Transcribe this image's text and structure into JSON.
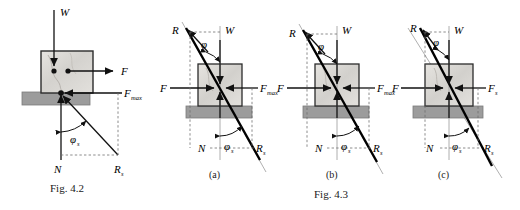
{
  "document": {
    "type": "physics-friction-figure",
    "background_color": "#ffffff"
  },
  "colors": {
    "block_fill": "#d8d6d2",
    "block_border": "#2b2b2b",
    "ground_fill": "#9c9c9c",
    "ground_border": "#6a6a6a",
    "line": "#111111",
    "dashed": "#6e6e6e",
    "text": "#000000"
  },
  "figures": [
    {
      "id": "fig-4-2",
      "caption": "Fig. 4.2",
      "sub_label": "",
      "labels": {
        "weight": "W",
        "applied_force": "F",
        "friction_max": "F",
        "friction_max_sub": "max",
        "normal": "N",
        "resultant": "R",
        "resultant_sub": "s",
        "angle": "φ",
        "angle_sub": "s"
      }
    },
    {
      "id": "fig-4-3-a",
      "caption": "",
      "sub_label": "(a)",
      "labels": {
        "weight": "W",
        "applied_force": "F",
        "friction_max": "F",
        "friction_max_sub": "max",
        "normal": "N",
        "resultant_top": "R",
        "resultant_bottom": "R",
        "resultant_bottom_sub": "s",
        "angle_top": "φ",
        "angle_bottom": "φ",
        "angle_bottom_sub": "s"
      }
    },
    {
      "id": "fig-4-3-b",
      "caption": "Fig. 4.3",
      "sub_label": "(b)",
      "labels": {
        "weight": "W",
        "applied_force": "F",
        "friction_max": "F",
        "friction_max_sub": "max",
        "normal": "N",
        "resultant_top": "R",
        "resultant_bottom": "R",
        "resultant_bottom_sub": "s",
        "angle_top": "φ",
        "angle_bottom": "φ",
        "angle_bottom_sub": "s"
      }
    },
    {
      "id": "fig-4-3-c",
      "caption": "",
      "sub_label": "(c)",
      "labels": {
        "weight": "W",
        "applied_force": "F",
        "friction_static": "F",
        "friction_static_sub": "s",
        "normal": "N",
        "resultant_top": "R",
        "resultant_bottom": "R",
        "resultant_bottom_sub": "s",
        "angle_top": "φ",
        "angle_bottom": "φ",
        "angle_bottom_sub": "s"
      }
    }
  ]
}
